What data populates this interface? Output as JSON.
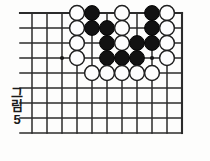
{
  "figure": {
    "caption_chars": [
      "그",
      "림"
    ],
    "caption_number": "5",
    "caption_full": "그림 5"
  },
  "board": {
    "colors": {
      "line": "#2b2b2b",
      "black_stone": "#121212",
      "white_stone": "#fdfdfd",
      "white_stone_outline": "#1f1f1f",
      "background": "#fdfdfc",
      "hoshi": "#181818"
    },
    "geometry": {
      "origin_x": 32,
      "origin_y": 13,
      "spacing": 15,
      "cols": 11,
      "rows": 9,
      "stone_radius": 7.4
    },
    "edges": {
      "top": "board-edge",
      "left": "open",
      "right": "board-edge",
      "bottom": "open"
    },
    "hoshi_points": [
      {
        "col": 2,
        "row": 3
      },
      {
        "col": 8,
        "row": 3
      }
    ],
    "stones": [
      {
        "col": 3,
        "row": 0,
        "color": "white"
      },
      {
        "col": 4,
        "row": 0,
        "color": "black"
      },
      {
        "col": 6,
        "row": 0,
        "color": "white"
      },
      {
        "col": 8,
        "row": 0,
        "color": "black"
      },
      {
        "col": 9,
        "row": 0,
        "color": "white"
      },
      {
        "col": 3,
        "row": 1,
        "color": "white"
      },
      {
        "col": 4,
        "row": 1,
        "color": "black"
      },
      {
        "col": 5,
        "row": 1,
        "color": "black"
      },
      {
        "col": 6,
        "row": 1,
        "color": "white"
      },
      {
        "col": 8,
        "row": 1,
        "color": "black"
      },
      {
        "col": 9,
        "row": 1,
        "color": "white"
      },
      {
        "col": 3,
        "row": 2,
        "color": "white"
      },
      {
        "col": 5,
        "row": 2,
        "color": "black"
      },
      {
        "col": 6,
        "row": 2,
        "color": "white"
      },
      {
        "col": 7,
        "row": 2,
        "color": "black"
      },
      {
        "col": 8,
        "row": 2,
        "color": "black"
      },
      {
        "col": 9,
        "row": 2,
        "color": "white"
      },
      {
        "col": 3,
        "row": 3,
        "color": "white"
      },
      {
        "col": 5,
        "row": 3,
        "color": "black"
      },
      {
        "col": 6,
        "row": 3,
        "color": "black"
      },
      {
        "col": 7,
        "row": 3,
        "color": "black"
      },
      {
        "col": 9,
        "row": 3,
        "color": "white"
      },
      {
        "col": 4,
        "row": 4,
        "color": "white"
      },
      {
        "col": 5,
        "row": 4,
        "color": "white"
      },
      {
        "col": 6,
        "row": 4,
        "color": "white"
      },
      {
        "col": 7,
        "row": 4,
        "color": "white"
      },
      {
        "col": 8,
        "row": 4,
        "color": "white"
      }
    ],
    "counts": {
      "black": 12,
      "white": 14,
      "total": 26
    }
  }
}
